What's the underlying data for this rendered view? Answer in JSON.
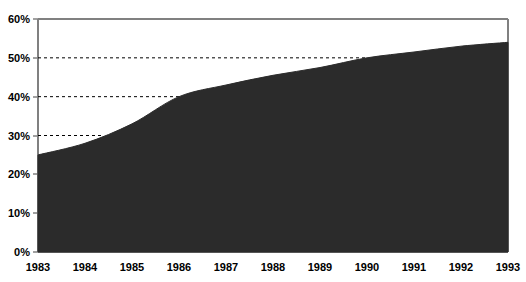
{
  "chart_data": {
    "type": "area",
    "title": "",
    "subtitle": "",
    "xlabel": "",
    "ylabel": "",
    "categories": [
      "1983",
      "1984",
      "1985",
      "1986",
      "1987",
      "1988",
      "1989",
      "1990",
      "1991",
      "1992",
      "1993"
    ],
    "x": [
      1983,
      1984,
      1985,
      1986,
      1987,
      1988,
      1989,
      1990,
      1991,
      1992,
      1993
    ],
    "values": [
      25,
      28,
      33,
      40,
      43,
      45.5,
      47.5,
      50,
      51.5,
      53,
      54
    ],
    "series": [
      {
        "name": "",
        "values": [
          25,
          28,
          33,
          40,
          43,
          45.5,
          47.5,
          50,
          51.5,
          53,
          54
        ]
      }
    ],
    "ylim": [
      0,
      60
    ],
    "xlim": [
      "1983",
      "1993"
    ],
    "ytick_values": [
      0,
      10,
      20,
      30,
      40,
      50,
      60
    ],
    "ytick_labels": [
      "0%",
      "10%",
      "20%",
      "30%",
      "40%",
      "50%",
      "60%"
    ],
    "xtick_labels": [
      "1983",
      "1984",
      "1985",
      "1986",
      "1987",
      "1988",
      "1989",
      "1990",
      "1991",
      "1992",
      "1993"
    ],
    "grid": true,
    "gridlines": [
      30,
      40,
      50
    ],
    "gridline_style": "dashed",
    "legend": false,
    "legend_position": "none",
    "area_color": "#2b2b2b",
    "axis_color": "#808080",
    "grid_color": "#000000",
    "background_color": "#ffffff",
    "annotations": []
  },
  "axes": {
    "y": {
      "ticks": [
        {
          "label": "60%",
          "value": 60
        },
        {
          "label": "50%",
          "value": 50
        },
        {
          "label": "40%",
          "value": 40
        },
        {
          "label": "30%",
          "value": 30
        },
        {
          "label": "20%",
          "value": 20
        },
        {
          "label": "10%",
          "value": 10
        },
        {
          "label": "0%",
          "value": 0
        }
      ]
    },
    "x": {
      "ticks": [
        {
          "label": "1983",
          "value": 1983
        },
        {
          "label": "1984",
          "value": 1984
        },
        {
          "label": "1985",
          "value": 1985
        },
        {
          "label": "1986",
          "value": 1986
        },
        {
          "label": "1987",
          "value": 1987
        },
        {
          "label": "1988",
          "value": 1988
        },
        {
          "label": "1989",
          "value": 1989
        },
        {
          "label": "1990",
          "value": 1990
        },
        {
          "label": "1991",
          "value": 1991
        },
        {
          "label": "1992",
          "value": 1992
        },
        {
          "label": "1993",
          "value": 1993
        }
      ]
    }
  }
}
